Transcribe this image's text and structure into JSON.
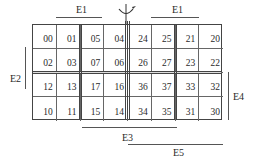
{
  "diagram": {
    "type": "karnaugh-map-5-variable",
    "grid": {
      "rows": [
        [
          "00",
          "01",
          "05",
          "04",
          "24",
          "25",
          "21",
          "20"
        ],
        [
          "02",
          "03",
          "07",
          "06",
          "26",
          "27",
          "23",
          "22"
        ],
        [
          "12",
          "13",
          "17",
          "16",
          "36",
          "37",
          "33",
          "32"
        ],
        [
          "10",
          "11",
          "15",
          "14",
          "34",
          "35",
          "31",
          "30"
        ]
      ]
    },
    "labels": {
      "e1_left": "E1",
      "e1_right": "E1",
      "e2": "E2",
      "e3": "E3",
      "e4": "E4",
      "e5": "E5"
    },
    "symbols": {
      "mirror_axis": "mirror-symmetry-arrow-icon"
    }
  }
}
